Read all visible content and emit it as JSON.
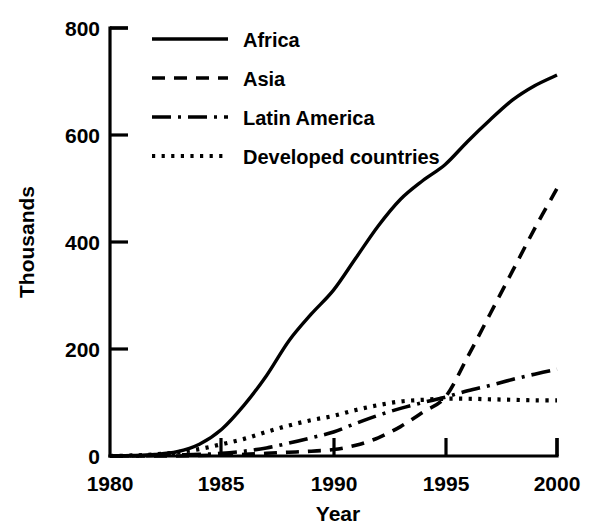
{
  "chart_data": {
    "type": "line",
    "title": "",
    "xlabel": "Year",
    "ylabel": "Thousands",
    "xlim": [
      1980,
      2000
    ],
    "ylim": [
      0,
      800
    ],
    "xticks": [
      "1980",
      "1985",
      "1990",
      "1995",
      "2000"
    ],
    "yticks": [
      "0",
      "200",
      "400",
      "600",
      "800"
    ],
    "grid": false,
    "legend_position": "top-left-inside",
    "x": [
      1980,
      1981,
      1982,
      1983,
      1984,
      1985,
      1986,
      1987,
      1988,
      1989,
      1990,
      1991,
      1992,
      1993,
      1994,
      1995,
      1996,
      1997,
      1998,
      1999,
      2000
    ],
    "series": [
      {
        "name": "Africa",
        "style": "solid",
        "values": [
          0,
          1,
          3,
          8,
          22,
          50,
          95,
          150,
          215,
          265,
          310,
          370,
          430,
          480,
          515,
          545,
          588,
          628,
          665,
          692,
          712
        ]
      },
      {
        "name": "Asia",
        "style": "dashed",
        "values": [
          0,
          0,
          0,
          0,
          1,
          2,
          3,
          5,
          7,
          9,
          12,
          20,
          34,
          55,
          82,
          110,
          185,
          265,
          345,
          425,
          500
        ]
      },
      {
        "name": "Latin America",
        "style": "dash-dot",
        "values": [
          0,
          0,
          1,
          2,
          3,
          5,
          9,
          15,
          24,
          34,
          45,
          61,
          76,
          89,
          100,
          110,
          122,
          132,
          143,
          153,
          162
        ]
      },
      {
        "name": "Developed countries",
        "style": "dotted",
        "values": [
          0,
          1,
          3,
          7,
          13,
          22,
          32,
          45,
          57,
          67,
          75,
          86,
          95,
          102,
          105,
          107,
          107,
          106,
          105,
          104,
          104
        ]
      }
    ]
  },
  "legend": {
    "items": [
      {
        "label": "Africa",
        "style": "solid"
      },
      {
        "label": "Asia",
        "style": "dashed"
      },
      {
        "label": "Latin America",
        "style": "dash-dot"
      },
      {
        "label": "Developed countries",
        "style": "dotted"
      }
    ]
  },
  "axes": {
    "y_title": "Thousands",
    "x_title": "Year",
    "x_tick_labels": [
      "1980",
      "1985",
      "1990",
      "1995",
      "2000"
    ],
    "y_tick_labels": [
      "0",
      "200",
      "400",
      "600",
      "800"
    ]
  },
  "colors": {
    "ink": "#000000",
    "background": "#ffffff"
  }
}
